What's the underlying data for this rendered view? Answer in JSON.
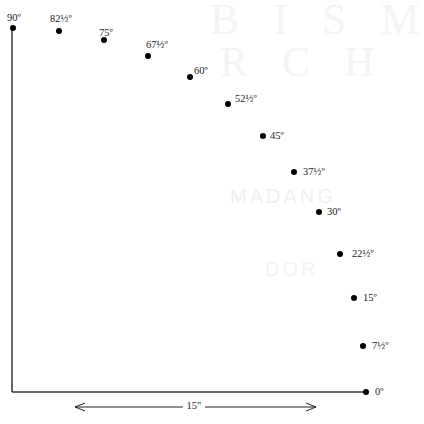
{
  "diagram": {
    "type": "angle-scale",
    "watermark": {
      "line1": "BISM",
      "line2": "RCH",
      "line3": "MADANG",
      "line4": "DOR"
    },
    "axis_color": "#333333",
    "dot_color": "#000000",
    "points": [
      {
        "label": "90º",
        "x": 13,
        "y": 28,
        "lx": 7,
        "ly": 13
      },
      {
        "label": "82½º",
        "x": 59,
        "y": 31,
        "lx": 50,
        "ly": 14
      },
      {
        "label": "75º",
        "x": 104,
        "y": 40,
        "lx": 99,
        "ly": 28
      },
      {
        "label": "67½º",
        "x": 148,
        "y": 56,
        "lx": 146,
        "ly": 40
      },
      {
        "label": "60º",
        "x": 190,
        "y": 77,
        "lx": 194,
        "ly": 66
      },
      {
        "label": "52½º",
        "x": 228,
        "y": 104,
        "lx": 235,
        "ly": 94
      },
      {
        "label": "45º",
        "x": 263,
        "y": 136,
        "lx": 270,
        "ly": 131
      },
      {
        "label": "37½º",
        "x": 294,
        "y": 172,
        "lx": 303,
        "ly": 167
      },
      {
        "label": "30º",
        "x": 319,
        "y": 212,
        "lx": 327,
        "ly": 207
      },
      {
        "label": "22½º",
        "x": 340,
        "y": 254,
        "lx": 352,
        "ly": 249
      },
      {
        "label": "15º",
        "x": 354,
        "y": 298,
        "lx": 363,
        "ly": 293
      },
      {
        "label": "7½º",
        "x": 363,
        "y": 346,
        "lx": 372,
        "ly": 341
      },
      {
        "label": "0º",
        "x": 366,
        "y": 392,
        "lx": 375,
        "ly": 387
      }
    ],
    "axes": {
      "origin": {
        "x": 12,
        "y": 392
      },
      "top": {
        "x": 12,
        "y": 28
      },
      "right": {
        "x": 366,
        "y": 392
      }
    },
    "dimension": {
      "label": "15\"",
      "x1": 75,
      "x2": 316,
      "y": 407
    }
  }
}
